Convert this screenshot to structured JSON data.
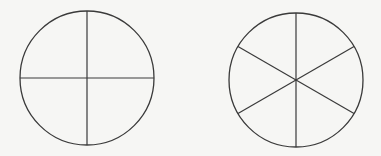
{
  "diagram": {
    "background": "#f6f6f4",
    "stroke_color": "#3a3a3a",
    "figures": [
      {
        "name": "circle-quarters",
        "cx": 87,
        "cy": 78,
        "r": 67,
        "divisions": 4,
        "start_angle_deg": 0
      },
      {
        "name": "circle-sixths",
        "cx": 296,
        "cy": 80,
        "r": 67,
        "divisions": 6,
        "start_angle_deg": 90
      }
    ]
  }
}
